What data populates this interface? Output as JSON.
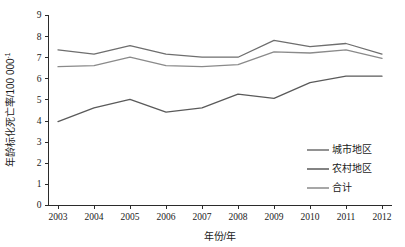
{
  "chart_data": {
    "type": "line",
    "title": "",
    "xlabel": "年份/年",
    "ylabel": "年龄标化死亡率/100 000",
    "ylabel_superscript": "-1",
    "categories": [
      "2003",
      "2004",
      "2005",
      "2006",
      "2007",
      "2008",
      "2009",
      "2010",
      "2011",
      "2012"
    ],
    "x": [
      2003,
      2004,
      2005,
      2006,
      2007,
      2008,
      2009,
      2010,
      2011,
      2012
    ],
    "xlim": [
      2003,
      2012
    ],
    "ylim": [
      0,
      9
    ],
    "yticks": [
      "0",
      "1",
      "2",
      "3",
      "4",
      "5",
      "6",
      "7",
      "8",
      "9"
    ],
    "grid": false,
    "legend_position": "lower-right",
    "series": [
      {
        "name": "城市地区",
        "color": "#6e6e6e",
        "values": [
          7.35,
          7.15,
          7.55,
          7.15,
          7.0,
          7.0,
          7.8,
          7.5,
          7.65,
          7.15
        ]
      },
      {
        "name": "农村地区",
        "color": "#5a5a5a",
        "values": [
          3.95,
          4.6,
          5.0,
          4.4,
          4.6,
          5.25,
          5.05,
          5.8,
          6.1,
          6.1
        ]
      },
      {
        "name": "合计",
        "color": "#8a8a8a",
        "values": [
          6.55,
          6.6,
          7.0,
          6.6,
          6.55,
          6.65,
          7.25,
          7.2,
          7.35,
          6.95
        ]
      }
    ]
  },
  "legend": {
    "items": [
      {
        "label": "城市地区"
      },
      {
        "label": "农村地区"
      },
      {
        "label": "合计"
      }
    ]
  }
}
